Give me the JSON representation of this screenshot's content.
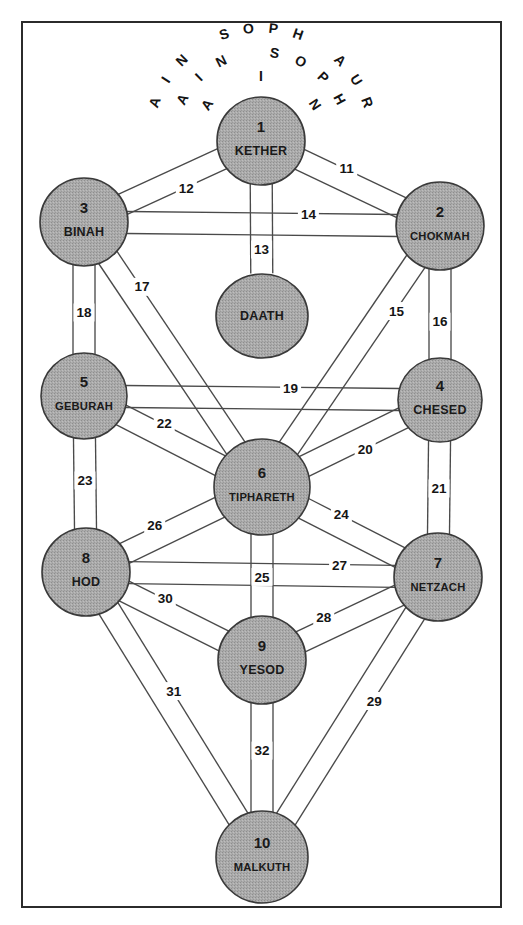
{
  "diagram": {
    "colors": {
      "sephirah_fill": "#a9a9a9",
      "sephirah_stroke": "#3a3a3a",
      "path_stroke": "#4a4a4a",
      "frame_stroke": "#2b2b2b",
      "background": "#ffffff",
      "text": "#1a1a1a"
    },
    "frame": {
      "x": 22,
      "y": 22,
      "width": 479,
      "height": 885
    }
  },
  "veils": [
    {
      "id": "veil-ain",
      "text": "AIN",
      "letters": [
        "A",
        "I",
        "N"
      ],
      "arc": "inner",
      "radius": 64,
      "start_angle": -56,
      "end_angle": 56
    },
    {
      "id": "veil-ain-soph",
      "text": "AIN SOPH",
      "letters": [
        "A",
        "I",
        "N",
        " ",
        "S",
        "O",
        "P",
        "H"
      ],
      "arc": "middle",
      "radius": 88,
      "start_angle": -62,
      "end_angle": 62
    },
    {
      "id": "veil-ain-soph-aur",
      "text": "AIN SOPH AUR",
      "letters": [
        "A",
        "I",
        "N",
        " ",
        "S",
        "O",
        "P",
        "H",
        " ",
        "A",
        "U",
        "R"
      ],
      "arc": "outer",
      "radius": 112,
      "start_angle": -70,
      "end_angle": 70
    }
  ],
  "sephiroth": [
    {
      "id": "kether",
      "number": "1",
      "name": "KETHER",
      "cx": 261,
      "cy": 141,
      "r": 44,
      "small": false
    },
    {
      "id": "chokmah",
      "number": "2",
      "name": "CHOKMAH",
      "cx": 440,
      "cy": 226,
      "r": 44,
      "small": true
    },
    {
      "id": "binah",
      "number": "3",
      "name": "BINAH",
      "cx": 84,
      "cy": 222,
      "r": 44,
      "small": false
    },
    {
      "id": "chesed",
      "number": "4",
      "name": "CHESED",
      "cx": 440,
      "cy": 400,
      "r": 42,
      "small": false
    },
    {
      "id": "geburah",
      "number": "5",
      "name": "GEBURAH",
      "cx": 84,
      "cy": 396,
      "r": 43,
      "small": true
    },
    {
      "id": "tiphareth",
      "number": "6",
      "name": "TIPHARETH",
      "cx": 262,
      "cy": 487,
      "r": 48,
      "small": true
    },
    {
      "id": "netzach",
      "number": "7",
      "name": "NETZACH",
      "cx": 438,
      "cy": 577,
      "r": 44,
      "small": true
    },
    {
      "id": "hod",
      "number": "8",
      "name": "HOD",
      "cx": 86,
      "cy": 572,
      "r": 44,
      "small": false
    },
    {
      "id": "yesod",
      "number": "9",
      "name": "YESOD",
      "cx": 262,
      "cy": 660,
      "r": 44,
      "small": false
    },
    {
      "id": "malkuth",
      "number": "10",
      "name": "MALKUTH",
      "cx": 262,
      "cy": 857,
      "r": 46,
      "small": true
    }
  ],
  "daath": {
    "id": "daath",
    "number": "",
    "name": "DAATH",
    "cx": 262,
    "cy": 316,
    "rx": 46,
    "ry": 42
  },
  "paths": [
    {
      "number": "11",
      "from": "kether",
      "to": "chokmah",
      "label_t": 0.45,
      "label_off": -12
    },
    {
      "number": "12",
      "from": "kether",
      "to": "binah",
      "label_t": 0.45,
      "label_off": -12
    },
    {
      "number": "13",
      "from": "kether",
      "to": "daath",
      "label_t": 0.62,
      "label_off": 0
    },
    {
      "number": "14",
      "from": "binah",
      "to": "chokmah",
      "label_t": 0.63,
      "label_off": -10
    },
    {
      "number": "15",
      "from": "chokmah",
      "to": "tiphareth",
      "label_t": 0.3,
      "label_off": -12
    },
    {
      "number": "16",
      "from": "chokmah",
      "to": "chesed",
      "label_t": 0.55,
      "label_off": 0
    },
    {
      "number": "17",
      "from": "binah",
      "to": "tiphareth",
      "label_t": 0.27,
      "label_off": -12
    },
    {
      "number": "18",
      "from": "binah",
      "to": "geburah",
      "label_t": 0.52,
      "label_off": 0
    },
    {
      "number": "19",
      "from": "geburah",
      "to": "chesed",
      "label_t": 0.58,
      "label_off": -10
    },
    {
      "number": "20",
      "from": "chesed",
      "to": "tiphareth",
      "label_t": 0.45,
      "label_off": -12
    },
    {
      "number": "21",
      "from": "chesed",
      "to": "netzach",
      "label_t": 0.5,
      "label_off": 0
    },
    {
      "number": "22",
      "from": "geburah",
      "to": "tiphareth",
      "label_t": 0.42,
      "label_off": -12
    },
    {
      "number": "23",
      "from": "geburah",
      "to": "hod",
      "label_t": 0.48,
      "label_off": 0
    },
    {
      "number": "24",
      "from": "tiphareth",
      "to": "netzach",
      "label_t": 0.42,
      "label_off": -12
    },
    {
      "number": "25",
      "from": "tiphareth",
      "to": "yesod",
      "label_t": 0.52,
      "label_off": 0
    },
    {
      "number": "26",
      "from": "hod",
      "to": "tiphareth",
      "label_t": 0.42,
      "label_off": -12
    },
    {
      "number": "27",
      "from": "hod",
      "to": "netzach",
      "label_t": 0.72,
      "label_off": -10
    },
    {
      "number": "28",
      "from": "yesod",
      "to": "netzach",
      "label_t": 0.38,
      "label_off": -12
    },
    {
      "number": "29",
      "from": "netzach",
      "to": "malkuth",
      "label_t": 0.42,
      "label_off": -12
    },
    {
      "number": "30",
      "from": "hod",
      "to": "yesod",
      "label_t": 0.42,
      "label_off": -12
    },
    {
      "number": "31",
      "from": "hod",
      "to": "malkuth",
      "label_t": 0.44,
      "label_off": -12
    },
    {
      "number": "32",
      "from": "yesod",
      "to": "malkuth",
      "label_t": 0.46,
      "label_off": 0
    }
  ]
}
